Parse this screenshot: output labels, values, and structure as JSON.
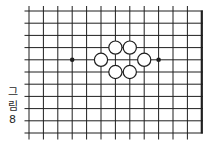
{
  "caption": {
    "full_text": "그림 8",
    "lines": [
      "그",
      "림",
      "8"
    ]
  },
  "board": {
    "columns": 13,
    "rows": 11,
    "origin_x": 29,
    "origin_y": 11,
    "col_spacing": 14.4,
    "row_spacing": 12.2,
    "stub_left": 4.5,
    "stub_top": 5,
    "stub_bottom": 6.5,
    "line_color": "#1f1f1f",
    "line_width": 1,
    "border_width": 2.2,
    "background_color": "#ffffff",
    "stone_radius": 6.6,
    "stone_stroke_width": 1.2,
    "stone_fill": "#ffffff",
    "star_radius": 2.3,
    "white_stones": [
      {
        "col": 7,
        "row": 4
      },
      {
        "col": 8,
        "row": 4
      },
      {
        "col": 6,
        "row": 5
      },
      {
        "col": 9,
        "row": 5
      },
      {
        "col": 7,
        "row": 6
      },
      {
        "col": 8,
        "row": 6
      }
    ],
    "star_points": [
      {
        "col": 4,
        "row": 5
      },
      {
        "col": 10,
        "row": 5
      }
    ]
  }
}
